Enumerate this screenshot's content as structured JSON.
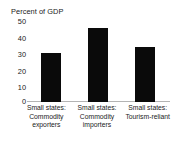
{
  "chart_data": {
    "type": "bar",
    "title": "Percent of GDP",
    "xlabel": "",
    "ylabel": "Percent of GDP",
    "ylim": [
      0,
      50
    ],
    "yticks": [
      0,
      10,
      20,
      30,
      40,
      50
    ],
    "ytick_labels": [
      "0",
      "10",
      "20",
      "30",
      "40",
      "50"
    ],
    "grid": false,
    "legend": null,
    "bar_color": "#0a0a0a",
    "background_color": "#ffffff",
    "axis_color": "#b4b4b4",
    "categories": [
      "Small states: Commodity exporters",
      "Small states: Commodity importers",
      "Small states: Tourism-reliant"
    ],
    "category_lines": [
      [
        "Small states:",
        "Commodity",
        "exporters"
      ],
      [
        "Small states:",
        "Commodity",
        "importers"
      ],
      [
        "Small states:",
        "Tourism-reliant"
      ]
    ],
    "values": [
      29,
      44,
      33
    ]
  }
}
